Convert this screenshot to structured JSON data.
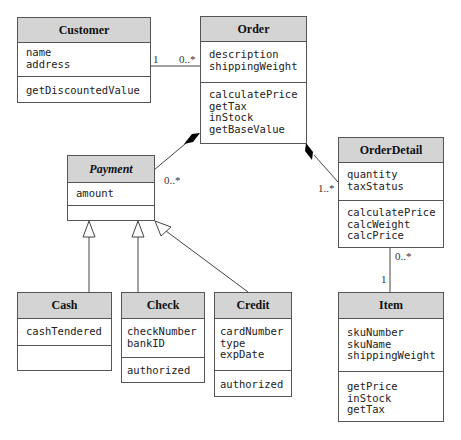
{
  "classes": {
    "customer": {
      "name": "Customer",
      "attributes": [
        "name",
        "address"
      ],
      "operations": [
        "getDiscountedValue"
      ]
    },
    "order": {
      "name": "Order",
      "attributes": [
        "description",
        "shippingWeight"
      ],
      "operations": [
        "calculatePrice",
        "getTax",
        "inStock",
        "getBaseValue"
      ]
    },
    "payment": {
      "name": "Payment",
      "abstract": true,
      "attributes": [
        "amount"
      ],
      "operations": []
    },
    "orderDetail": {
      "name": "OrderDetail",
      "attributes": [
        "quantity",
        "taxStatus"
      ],
      "operations": [
        "calculatePrice",
        "calcWeight",
        "calcPrice"
      ]
    },
    "cash": {
      "name": "Cash",
      "attributes": [
        "cashTendered"
      ],
      "operations": []
    },
    "check": {
      "name": "Check",
      "attributes": [
        "checkNumber",
        "bankID"
      ],
      "operations": [
        "authorized"
      ]
    },
    "credit": {
      "name": "Credit",
      "attributes": [
        "cardNumber",
        "type",
        "expDate"
      ],
      "operations": [
        "authorized"
      ]
    },
    "item": {
      "name": "Item",
      "attributes": [
        "skuNumber",
        "skuName",
        "shippingWeight"
      ],
      "operations": [
        "getPrice",
        "inStock",
        "getTax"
      ]
    }
  },
  "multiplicities": {
    "customer_order_customer_end": "1",
    "customer_order_order_end": "0..*",
    "order_payment_payment_end": "0..*",
    "order_detail_detail_end": "1..*",
    "detail_item_detail_end": "0..*",
    "detail_item_item_end": "1"
  },
  "relationships": [
    {
      "type": "association",
      "from": "Customer",
      "to": "Order"
    },
    {
      "type": "composition",
      "whole": "Order",
      "part": "Payment"
    },
    {
      "type": "composition",
      "whole": "Order",
      "part": "OrderDetail"
    },
    {
      "type": "association",
      "from": "OrderDetail",
      "to": "Item"
    },
    {
      "type": "generalization",
      "child": "Cash",
      "parent": "Payment"
    },
    {
      "type": "generalization",
      "child": "Check",
      "parent": "Payment"
    },
    {
      "type": "generalization",
      "child": "Credit",
      "parent": "Payment"
    }
  ]
}
